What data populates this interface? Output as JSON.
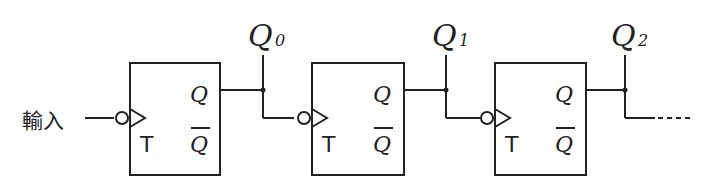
{
  "diagram": {
    "type": "asynchronous counter (T flip-flop ripple chain)",
    "input_label": "輸入",
    "flip_flops": [
      {
        "id": "ff0",
        "clock_label": "T",
        "q_label": "Q",
        "qbar_label": "Q",
        "output_label": "Q",
        "output_subscript": "0"
      },
      {
        "id": "ff1",
        "clock_label": "T",
        "q_label": "Q",
        "qbar_label": "Q",
        "output_label": "Q",
        "output_subscript": "1"
      },
      {
        "id": "ff2",
        "clock_label": "T",
        "q_label": "Q",
        "qbar_label": "Q",
        "output_label": "Q",
        "output_subscript": "2"
      }
    ],
    "continuation": "----",
    "colors": {
      "line": "#222222",
      "background": "#ffffff"
    }
  }
}
